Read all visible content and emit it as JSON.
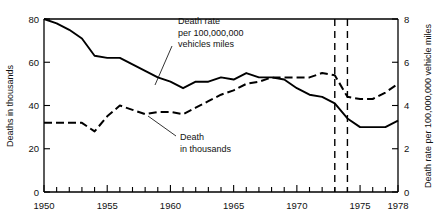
{
  "chart_data": {
    "type": "line",
    "title": "",
    "xlabel": "",
    "ylabel": "Deaths in thousands",
    "y2label": "Death rate per 100,000,000 vehicle miles",
    "xlim": [
      1950,
      1978
    ],
    "ylim": [
      0,
      80
    ],
    "y2lim": [
      0,
      8
    ],
    "grid": false,
    "legend": "annotations",
    "x_ticks": [
      1950,
      1951,
      1952,
      1953,
      1954,
      1955,
      1956,
      1957,
      1958,
      1959,
      1960,
      1961,
      1962,
      1963,
      1964,
      1965,
      1966,
      1967,
      1968,
      1969,
      1970,
      1971,
      1972,
      1973,
      1974,
      1975,
      1976,
      1977,
      1978
    ],
    "x_tick_labels": [
      "1950",
      "1955",
      "1960",
      "1965",
      "1970",
      "1975",
      "1978"
    ],
    "x_labeled_ticks": [
      1950,
      1955,
      1960,
      1965,
      1970,
      1975,
      1978
    ],
    "y_ticks": [
      0,
      20,
      40,
      60,
      80
    ],
    "y_tick_labels": [
      "0",
      "20",
      "40",
      "60",
      "80"
    ],
    "y2_ticks": [
      0,
      2,
      4,
      6,
      8
    ],
    "y2_tick_labels": [
      "0",
      "2",
      "4",
      "6",
      "8"
    ],
    "x": [
      1950,
      1951,
      1952,
      1953,
      1954,
      1955,
      1956,
      1957,
      1958,
      1959,
      1960,
      1961,
      1962,
      1963,
      1964,
      1965,
      1966,
      1967,
      1968,
      1969,
      1970,
      1971,
      1972,
      1973,
      1974,
      1975,
      1976,
      1977,
      1978
    ],
    "series": [
      {
        "name": "Death rate per 100,000,000 vehicles miles",
        "style": "solid",
        "axis": "right",
        "units": "deaths per 100,000,000 vehicle miles",
        "values": [
          8.0,
          7.8,
          7.5,
          7.1,
          6.3,
          6.2,
          6.2,
          5.9,
          5.6,
          5.3,
          5.1,
          4.8,
          5.1,
          5.1,
          5.3,
          5.2,
          5.5,
          5.3,
          5.3,
          5.2,
          4.8,
          4.5,
          4.4,
          4.1,
          3.4,
          3.0,
          3.0,
          3.0,
          3.3
        ]
      },
      {
        "name": "Death in thousands",
        "style": "dashed",
        "axis": "left",
        "units": "thousands of deaths",
        "values": [
          32,
          32,
          32,
          32,
          28,
          35,
          40,
          38,
          36,
          37,
          37,
          36,
          39,
          42,
          45,
          47,
          50,
          51,
          53,
          53,
          53,
          53,
          55,
          54,
          44,
          43,
          43,
          46,
          50
        ]
      }
    ],
    "vertical_markers": [
      {
        "x": 1973,
        "style": "dashed"
      },
      {
        "x": 1974,
        "style": "dashed"
      }
    ],
    "annotations": [
      {
        "name": "death-rate-annotation",
        "lines": [
          "Death rate",
          "per 100,000,000",
          "vehicles miles"
        ],
        "text_x": 178,
        "text_y": 24,
        "leader": {
          "x1": 172,
          "y1": 46,
          "x2": 155,
          "y2": 85
        }
      },
      {
        "name": "death-thousands-annotation",
        "lines": [
          "Death",
          "in thousands"
        ],
        "text_x": 180,
        "text_y": 140,
        "leader": {
          "x1": 176,
          "y1": 136,
          "x2": 148,
          "y2": 116
        }
      }
    ]
  }
}
